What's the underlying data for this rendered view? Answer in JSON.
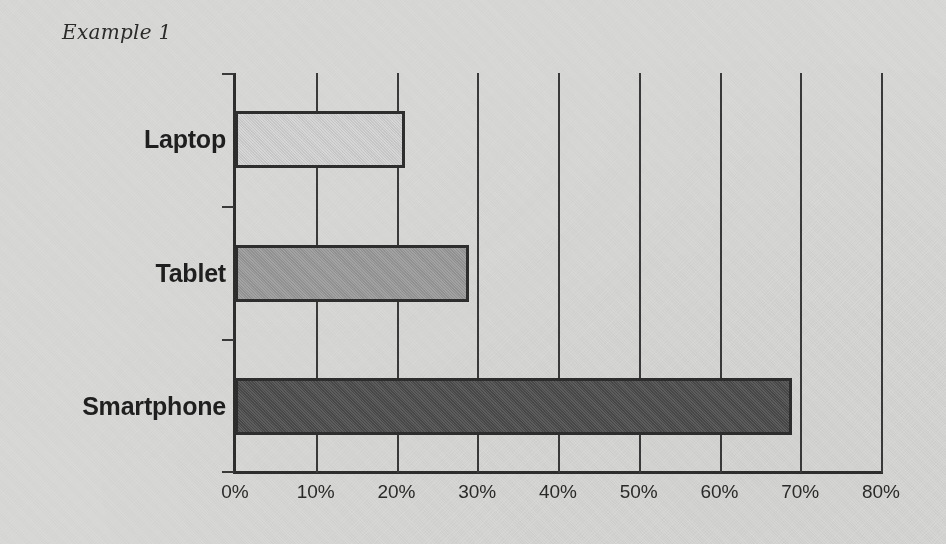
{
  "chart_data": {
    "type": "bar",
    "orientation": "horizontal",
    "title": "Example 1",
    "categories": [
      "Laptop",
      "Tablet",
      "Smartphone"
    ],
    "values": [
      21,
      29,
      69
    ],
    "value_unit": "%",
    "xlabel": "",
    "ylabel": "",
    "xlim": [
      0,
      80
    ],
    "xticks": [
      0,
      10,
      20,
      30,
      40,
      50,
      60,
      70,
      80
    ],
    "xtick_labels": [
      "0%",
      "10%",
      "20%",
      "30%",
      "40%",
      "50%",
      "60%",
      "70%",
      "80%"
    ],
    "grid": "vertical",
    "legend": "none",
    "bar_colors": [
      "#d4d4d4",
      "#9b9b9b",
      "#4d4d4d"
    ],
    "bar_border_color": "#2e2e2e",
    "background_color": "#d9d9d7",
    "axis_color": "#2e2e2e"
  }
}
